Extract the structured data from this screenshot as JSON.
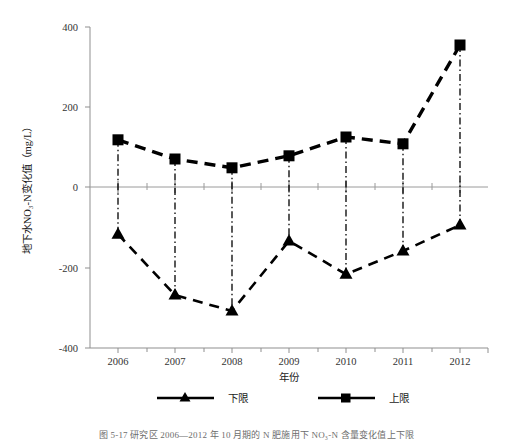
{
  "chart_data": {
    "type": "line",
    "title": "",
    "xlabel": "年份",
    "ylabel": "地下水NO₃-N变化值（mg/L）",
    "categories": [
      "2006",
      "2007",
      "2008",
      "2009",
      "2010",
      "2011",
      "2012"
    ],
    "series": [
      {
        "name": "下限",
        "marker": "triangle",
        "values": [
          -118,
          -270,
          -310,
          -135,
          -218,
          -160,
          -95
        ]
      },
      {
        "name": "上限",
        "marker": "square",
        "values": [
          118,
          70,
          48,
          78,
          125,
          108,
          355
        ]
      }
    ],
    "ylim": [
      -400,
      400
    ],
    "yticks": [
      400,
      200,
      0,
      -200,
      -400
    ],
    "ytick_labels": [
      "400",
      "200",
      "0",
      "-200",
      "-400"
    ],
    "xticks": [
      "2006",
      "2007",
      "2008",
      "2009",
      "2010",
      "2011",
      "2012"
    ],
    "grid": false,
    "legend_position": "bottom",
    "line_style": "dashed",
    "color": "#000000",
    "zero_line": true,
    "dropline_style": "dash-dot"
  },
  "legend": {
    "items": [
      {
        "label": "下限",
        "marker": "triangle-icon"
      },
      {
        "label": "上限",
        "marker": "square-icon"
      }
    ]
  },
  "caption": {
    "text": "图 5-17   研究区 2006—2012 年 10 月期的 N 肥施用下 NO₃-N 含量变化值上下限"
  }
}
